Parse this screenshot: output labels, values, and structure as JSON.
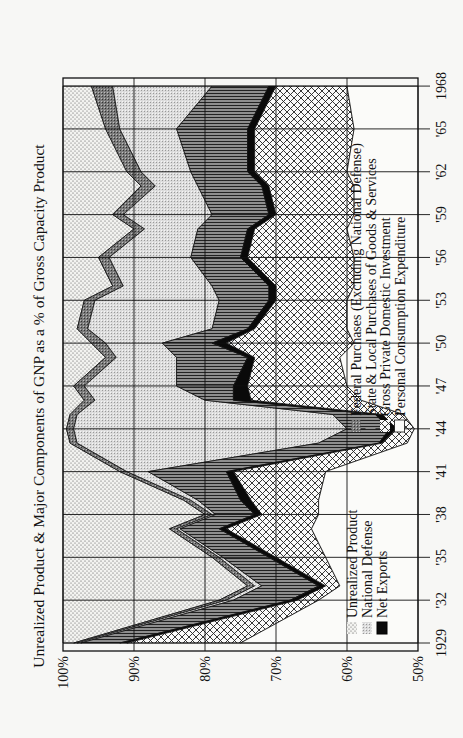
{
  "chart_data": {
    "type": "area",
    "orientation": "rotated-90-clockwise",
    "title": "Unrealized Product & Major Components of GNP as a % of Gross Capacity Product",
    "xlabel": "",
    "ylabel": "",
    "ylim": [
      50,
      100
    ],
    "y_ticks": [
      "100%",
      "90%",
      "80%",
      "70%",
      "60%",
      "50%"
    ],
    "x_ticks": [
      "1929",
      "'32",
      "'35",
      "'38",
      "'41",
      "'44",
      "'47",
      "'50",
      "'53",
      "'56",
      "'59",
      "'62",
      "'65",
      "1968"
    ],
    "grid": true,
    "years": [
      1929,
      1932,
      1933,
      1935,
      1937,
      1938,
      1939,
      1941,
      1943,
      1944,
      1945,
      1946,
      1947,
      1949,
      1950,
      1951,
      1953,
      1954,
      1956,
      1958,
      1959,
      1961,
      1962,
      1965,
      1968
    ],
    "boundaries_note": "Cumulative percent position of the right edge of each band, measured from 100% at left; bands stacked left to right in series order.",
    "series": [
      {
        "name": "Unrealized Product",
        "pattern": "stipple",
        "cum": [
          98.5,
          78,
          74,
          79,
          85,
          80,
          83,
          92,
          99,
          99.5,
          99,
          97,
          98.5,
          94,
          96,
          98,
          97,
          93,
          95,
          90,
          93,
          89,
          91,
          94,
          96
        ]
      },
      {
        "name": "Federal Purchases (Excluding National Defense)",
        "pattern": "dark-dither",
        "cum": [
          98,
          77,
          73,
          78,
          84,
          79,
          82,
          91,
          98,
          98.5,
          98,
          95.5,
          97,
          92.5,
          94,
          96.5,
          95.5,
          91.5,
          93.5,
          88.5,
          91.5,
          87,
          89,
          92,
          93
        ]
      },
      {
        "name": "National Defense",
        "pattern": "light-dither",
        "cum": [
          97.5,
          76,
          72,
          77.5,
          83.5,
          78.5,
          81,
          88,
          64,
          60,
          62,
          80,
          84,
          84,
          86,
          79,
          78,
          79,
          82,
          81,
          79,
          81,
          82,
          84,
          79
        ]
      },
      {
        "name": "State & Local Purchases of Goods & Services",
        "pattern": "horizontal-stripes",
        "cum": [
          92,
          68,
          64,
          71,
          78,
          73,
          75,
          77,
          55.5,
          54,
          56,
          76,
          76,
          74,
          79,
          74,
          71,
          71,
          75,
          74,
          71,
          72,
          74,
          74,
          71
        ]
      },
      {
        "name": "Net Exports",
        "pattern": "solid-black",
        "cum": [
          91,
          67,
          63,
          70,
          77,
          72,
          73.5,
          76,
          55,
          53,
          55,
          73.5,
          74,
          73,
          77,
          73,
          70,
          70,
          74,
          73,
          70,
          71,
          73,
          73,
          70
        ]
      },
      {
        "name": "Gross Private Domestic Investment",
        "pattern": "crosshatch",
        "cum": [
          75,
          64,
          61,
          63,
          65,
          64,
          64,
          63,
          51.5,
          50.5,
          52,
          58,
          60,
          61,
          59,
          60,
          60,
          59,
          59,
          60,
          59,
          59,
          60,
          59,
          60
        ]
      },
      {
        "name": "Personal Consumption Expenditure",
        "pattern": "white",
        "cum": [
          50,
          50,
          50,
          50,
          50,
          50,
          50,
          50,
          50,
          50,
          50,
          50,
          50,
          50,
          50,
          50,
          50,
          50,
          50,
          50,
          50,
          50,
          50,
          50,
          50
        ]
      }
    ],
    "legend": [
      {
        "label": "Unrealized Product",
        "pattern": "stipple"
      },
      {
        "label": "National Defense",
        "pattern": "light-dither"
      },
      {
        "label": "Net Exports",
        "pattern": "solid-black"
      },
      {
        "label": "Federal Purchases (Excluding National Defense)",
        "pattern": "dark-dither"
      },
      {
        "label": "State & Local Purchases of Goods & Services",
        "pattern": "horizontal-stripes"
      },
      {
        "label": "Gross Private Domestic Investment",
        "pattern": "crosshatch"
      },
      {
        "label": "Personal Consumption Expenditure",
        "pattern": "white"
      }
    ],
    "legend_position": "inside, lower-right of plot (rotated)"
  },
  "labels": {
    "title": "Unrealized Product & Major Components of GNP as a % of Gross Capacity Product",
    "legend_left": [
      "Unrealized Product",
      "National Defense",
      "Net Exports"
    ],
    "legend_right": [
      "Federal Purchases (Excluding National Defense)",
      "State & Local Purchases of Goods & Services",
      "Gross Private Domestic Investment",
      "Personal Consumption Expenditure"
    ]
  }
}
